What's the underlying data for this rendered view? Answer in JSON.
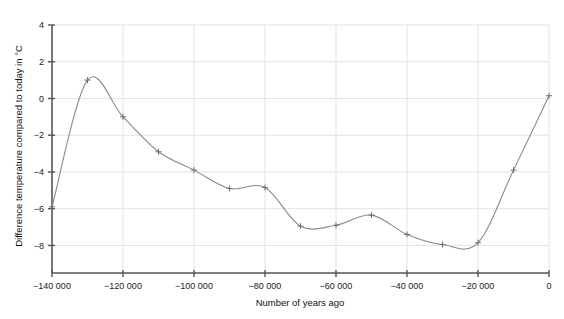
{
  "chart_data": {
    "type": "line",
    "title": "",
    "subtitle": "",
    "xlabel": "Number of years ago",
    "ylabel": "Difference temperature compared to today in °C",
    "xlim": [
      -140000,
      0
    ],
    "ylim": [
      -9.5,
      4
    ],
    "xticks": [
      -140000,
      -120000,
      -100000,
      -80000,
      -60000,
      -40000,
      -20000,
      0
    ],
    "xticklabels": [
      "−140 000",
      "−120 000",
      "−100 000",
      "−80 000",
      "−60 000",
      "−40 000",
      "−20 000",
      "0"
    ],
    "yticks": [
      4,
      2,
      0,
      -2,
      -4,
      -6,
      -8
    ],
    "yticklabels": [
      "4",
      "2",
      "0",
      "−2",
      "−4",
      "−6",
      "−8"
    ],
    "grid": true,
    "grid_color": "#dcdcdc",
    "axis_color": "#555555",
    "line_color": "#8a8a8a",
    "marker": "plus",
    "marker_color": "#6e6e6e",
    "legend": null,
    "series": [
      {
        "name": "Temperature difference",
        "x": [
          -140000,
          -130000,
          -120000,
          -110000,
          -100000,
          -90000,
          -80000,
          -70000,
          -60000,
          -50000,
          -40000,
          -30000,
          -20000,
          -10000,
          0
        ],
        "values": [
          -5.9,
          1.0,
          -1.0,
          -2.9,
          -3.9,
          -4.9,
          -4.85,
          -6.95,
          -6.9,
          -6.35,
          -7.4,
          -7.95,
          -7.85,
          -3.9,
          0.15
        ]
      }
    ],
    "annotations": [
      {
        "label": "peak",
        "x": -127000,
        "y": 1.55
      },
      {
        "label": "global minimum",
        "x": -23000,
        "y": -8.15
      }
    ]
  }
}
